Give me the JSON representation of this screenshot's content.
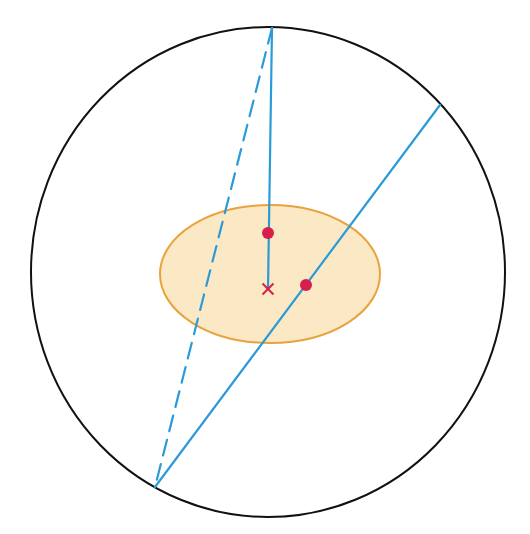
{
  "diagram": {
    "canvas": {
      "width": 530,
      "height": 534,
      "background": "#ffffff"
    },
    "outer_circle": {
      "cx": 268,
      "cy": 272,
      "rx": 237,
      "ry": 245,
      "stroke": "#111111",
      "stroke_width": 2
    },
    "inner_ellipse": {
      "cx": 270,
      "cy": 274,
      "rx": 110,
      "ry": 69,
      "fill": "#fbe8c4",
      "stroke": "#e8a33c",
      "stroke_width": 2
    },
    "points": {
      "top": {
        "x": 272,
        "y": 28
      },
      "bottom_left": {
        "x": 155,
        "y": 487
      },
      "upper_right": {
        "x": 440,
        "y": 105
      },
      "center_cross": {
        "x": 268,
        "y": 289
      },
      "dot_upper": {
        "x": 268,
        "y": 233
      },
      "dot_right": {
        "x": 306,
        "y": 285
      }
    },
    "lines": [
      {
        "name": "vertical-line",
        "from": "top",
        "to": "center_cross",
        "style": "solid",
        "color": "#2b9ad8"
      },
      {
        "name": "dashed-line",
        "from": "top",
        "to": "bottom_left",
        "style": "dashed",
        "color": "#2b9ad8"
      },
      {
        "name": "diagonal-line",
        "from": "upper_right",
        "to": "bottom_left",
        "style": "solid",
        "color": "#2b9ad8"
      }
    ],
    "markers": {
      "dot_color": "#d81e4a",
      "dot_radius": 6,
      "cross_color": "#d81e4a"
    }
  }
}
